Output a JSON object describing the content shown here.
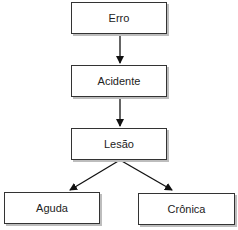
{
  "diagram": {
    "nodes": [
      {
        "id": "erro",
        "label": "Erro"
      },
      {
        "id": "acidente",
        "label": "Acidente"
      },
      {
        "id": "lesao",
        "label": "Lesão"
      },
      {
        "id": "aguda",
        "label": "Aguda"
      },
      {
        "id": "cronica",
        "label": "Crônica"
      }
    ],
    "edges": [
      {
        "from": "erro",
        "to": "acidente"
      },
      {
        "from": "acidente",
        "to": "lesao"
      },
      {
        "from": "lesao",
        "to": "aguda"
      },
      {
        "from": "lesao",
        "to": "cronica"
      }
    ]
  }
}
